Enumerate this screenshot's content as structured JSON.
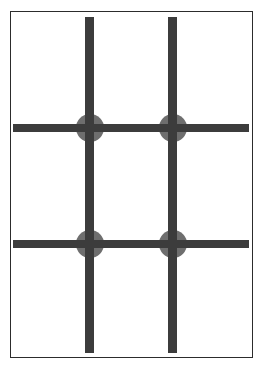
{
  "figure": {
    "background_color": "#ffffff",
    "frame": {
      "label": "page-border",
      "color": "#2c2c2c",
      "stroke_width": 1.5,
      "x": 10,
      "y": 11,
      "width": 243,
      "height": 347
    }
  },
  "chart_data": {
    "type": "diagram",
    "xlabel": "",
    "ylabel": "",
    "grid": true,
    "legend": null,
    "xlim": [
      0,
      241
    ],
    "ylim": [
      0,
      345
    ],
    "colors": {
      "line": "#3c3c3c",
      "node": "#6e6e6e",
      "frame": "#2c2c2c",
      "background": "#ffffff"
    },
    "vertical_lines": [
      {
        "name": "vertical-line-left",
        "x": 74,
        "y": 5,
        "length": 336,
        "thickness": 9
      },
      {
        "name": "vertical-line-right",
        "x": 157,
        "y": 5,
        "length": 336,
        "thickness": 9
      }
    ],
    "horizontal_lines": [
      {
        "name": "horizontal-line-top",
        "x": 2,
        "y": 112,
        "length": 236,
        "thickness": 8
      },
      {
        "name": "horizontal-line-bottom",
        "x": 2,
        "y": 228,
        "length": 236,
        "thickness": 8
      }
    ],
    "nodes": [
      {
        "name": "node-top-left",
        "cx": 79,
        "cy": 116,
        "r": 14
      },
      {
        "name": "node-top-right",
        "cx": 162,
        "cy": 116,
        "r": 14
      },
      {
        "name": "node-bottom-left",
        "cx": 79,
        "cy": 232,
        "r": 14
      },
      {
        "name": "node-bottom-right",
        "cx": 162,
        "cy": 232,
        "r": 14
      }
    ],
    "counts": {
      "vertical_lines": 2,
      "horizontal_lines": 2,
      "nodes": 4
    }
  }
}
